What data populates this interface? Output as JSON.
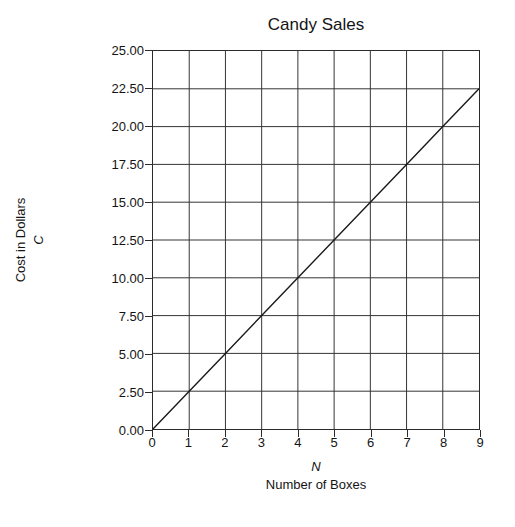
{
  "chart_data": {
    "type": "line",
    "title": "Candy Sales",
    "xlabel": "Number of Boxes",
    "xlabel_symbol": "N",
    "ylabel": "Cost in Dollars",
    "ylabel_symbol": "C",
    "xlim": [
      0,
      9
    ],
    "ylim": [
      0,
      25
    ],
    "xticks": [
      "0",
      "1",
      "2",
      "3",
      "4",
      "5",
      "6",
      "7",
      "8",
      "9"
    ],
    "xtick_values": [
      0,
      1,
      2,
      3,
      4,
      5,
      6,
      7,
      8,
      9
    ],
    "yticks": [
      "0.00",
      "2.50",
      "5.00",
      "7.50",
      "10.00",
      "12.50",
      "15.00",
      "17.50",
      "20.00",
      "22.50",
      "25.00"
    ],
    "ytick_values": [
      0,
      2.5,
      5,
      7.5,
      10,
      12.5,
      15,
      17.5,
      20,
      22.5,
      25
    ],
    "grid": true,
    "legend": "none",
    "series": [
      {
        "name": "Cost",
        "x": [
          0,
          1,
          2,
          3,
          4,
          5,
          6,
          7,
          8,
          9
        ],
        "values": [
          0.0,
          2.5,
          5.0,
          7.5,
          10.0,
          12.5,
          15.0,
          17.5,
          20.0,
          22.5
        ],
        "color": "#1a1a1a",
        "relationship": "C = 2.50N"
      }
    ]
  },
  "colors": {
    "axis": "#2b2b2b",
    "grid": "#333333",
    "line": "#1a1a1a",
    "text": "#141414",
    "background": "#ffffff"
  }
}
